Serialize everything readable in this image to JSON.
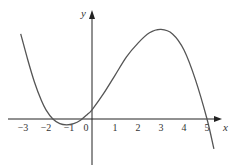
{
  "chart_data": {
    "type": "line",
    "title": "",
    "xlabel": "x",
    "ylabel": "y",
    "xlim": [
      -3.5,
      5.6
    ],
    "ylim": [
      -2.2,
      5
    ],
    "xticks": [
      -3,
      -2,
      -1,
      0,
      1,
      2,
      3,
      4,
      5
    ],
    "xtick_labels": [
      "−3",
      "−2",
      "−1",
      "0",
      "1",
      "2",
      "3",
      "4",
      "5"
    ],
    "grid": false,
    "series": [
      {
        "name": "curve",
        "x": [
          -3.1,
          -2.8,
          -2.5,
          -2.2,
          -2.0,
          -1.7,
          -1.4,
          -1.1,
          -0.8,
          -0.5,
          -0.2,
          0,
          0.5,
          1,
          1.5,
          2,
          2.5,
          3,
          3.5,
          4,
          4.5,
          5,
          5.3
        ],
        "y": [
          3.7,
          2.6,
          1.6,
          0.8,
          0.4,
          0.0,
          -0.2,
          -0.25,
          -0.2,
          -0.05,
          0.2,
          0.4,
          1.1,
          1.9,
          2.7,
          3.3,
          3.75,
          3.9,
          3.7,
          3.0,
          1.7,
          0.0,
          -1.3
        ]
      }
    ]
  }
}
